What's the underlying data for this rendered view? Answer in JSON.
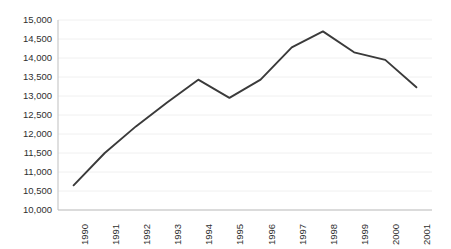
{
  "chart_data": {
    "type": "line",
    "title": "",
    "subtitle": "",
    "xlabel": "",
    "ylabel": "",
    "categories": [
      "1990",
      "1991",
      "1992",
      "1993",
      "1994",
      "1995",
      "1996",
      "1997",
      "1998",
      "1999",
      "2000",
      "2001"
    ],
    "values": [
      10650,
      11500,
      12200,
      12830,
      13430,
      12950,
      13430,
      14280,
      14700,
      14150,
      13950,
      13230
    ],
    "series": [
      {
        "name": "",
        "values": [
          10650,
          11500,
          12200,
          12830,
          13430,
          12950,
          13430,
          14280,
          14700,
          14150,
          13950,
          13230
        ]
      }
    ],
    "ylim": [
      10000,
      15000
    ],
    "ytick_step": 500,
    "ytick_labels": [
      "15,000",
      "14,500",
      "14,000",
      "13,500",
      "13,000",
      "12,500",
      "12,000",
      "11,500",
      "11,000",
      "10,500",
      "10,000"
    ],
    "ytick_values": [
      15000,
      14500,
      14000,
      13500,
      13000,
      12500,
      12000,
      11500,
      11000,
      10500,
      10000
    ],
    "xtick_labels": [
      "1990",
      "1991",
      "1992",
      "1993",
      "1994",
      "1995",
      "1996",
      "1997",
      "1998",
      "1999",
      "2000",
      "2001"
    ],
    "grid": true,
    "grid_axis": "y",
    "legend": false,
    "legend_position": "none",
    "markers": false,
    "annotations": [],
    "colors": {
      "line": "#3a3a3a",
      "gridline": "#f0f0f0",
      "axis": "#bfbfbf",
      "text": "#2f2f2f",
      "background": "#ffffff"
    },
    "line_width": 1.9,
    "x_tick_rotation": -90
  },
  "plot_geometry": {
    "left": 58,
    "right": 432,
    "top": 20,
    "bottom": 210
  }
}
